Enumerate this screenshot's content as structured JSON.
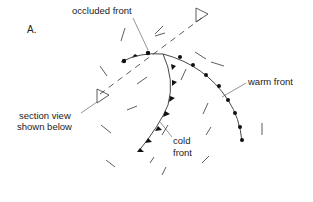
{
  "panel_label": "A.",
  "labels": {
    "occluded_front": "occluded front",
    "warm_front": "warm front",
    "section_line": [
      "section view",
      "shown below"
    ],
    "cold_front": [
      "cold",
      "front"
    ]
  },
  "colors": {
    "line": "#333333",
    "symbol": "#111111",
    "text": "#222222",
    "background": "#ffffff"
  }
}
